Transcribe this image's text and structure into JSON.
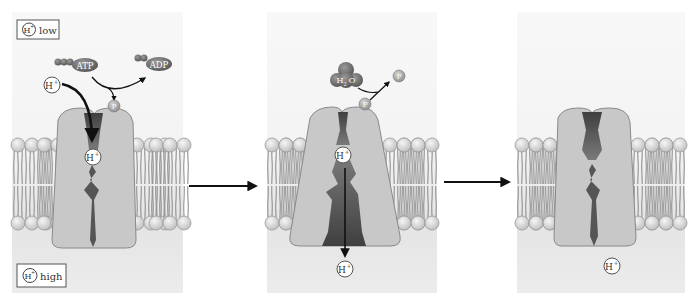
{
  "diagram": {
    "type": "proton-pump-mechanism",
    "panels": [
      {
        "id": "panel-1",
        "labels": {
          "top_box": "low",
          "bottom_box": "high",
          "ion": "H",
          "ion_charge": "+",
          "atp": "ATP",
          "adp": "ADP",
          "phosphate": "P"
        }
      },
      {
        "id": "panel-2",
        "labels": {
          "water": "H2O",
          "water_main": "H",
          "water_sub": "2",
          "water_tail": "O",
          "phosphate_bound": "P",
          "phosphate_released": "P",
          "ion": "H",
          "ion_charge": "+"
        }
      },
      {
        "id": "panel-3",
        "labels": {
          "ion": "H",
          "ion_charge": "+"
        }
      }
    ],
    "colors": {
      "panel_top": "#f7f7f7",
      "panel_bottom": "#e6e6e6",
      "protein": "#c9c9c9",
      "protein_outline": "#8a8a8a",
      "channel": "#5a5a5a",
      "lipid_head": "#d8d8d8",
      "lipid_tail": "#9a9a9a",
      "molecule_dark": "#6e6e6e",
      "arrow": "#1a1a1a"
    }
  }
}
